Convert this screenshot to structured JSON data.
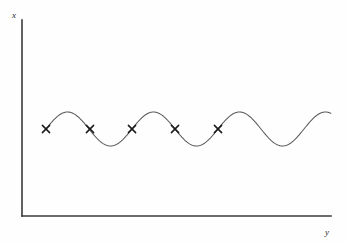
{
  "figure": {
    "background_color": "#fefefe",
    "axis_color": "#3a3a3a",
    "curve_color": "#5a5a5a",
    "marker_color": "#1a1a1a"
  },
  "axes": {
    "vertical": {
      "label": "x",
      "label_name": "x-axis-label",
      "x": 22,
      "y_top": 20,
      "y_bottom": 216
    },
    "horizontal": {
      "label": "y",
      "label_name": "y-axis-label",
      "y": 216,
      "x_left": 22,
      "x_right": 331
    }
  },
  "chart_data": {
    "type": "line",
    "title": "",
    "xlabel": "y",
    "ylabel": "x",
    "grid": false,
    "legend": null,
    "curve": {
      "name": "sinusoid",
      "description": "sine wave oscillating about a horizontal centerline",
      "centerline_y": 129,
      "amplitude_px": 17,
      "period_px": 86,
      "x_start": 46,
      "x_end": 331,
      "phase": "rising from centerline at x_start"
    },
    "markers": {
      "symbol": "x",
      "count": 5,
      "description": "cross markers placed on the curve near the centerline",
      "points": [
        {
          "x": 46,
          "y": 129
        },
        {
          "x": 90,
          "y": 129
        },
        {
          "x": 132,
          "y": 129
        },
        {
          "x": 175,
          "y": 129
        },
        {
          "x": 218,
          "y": 129
        }
      ]
    }
  }
}
